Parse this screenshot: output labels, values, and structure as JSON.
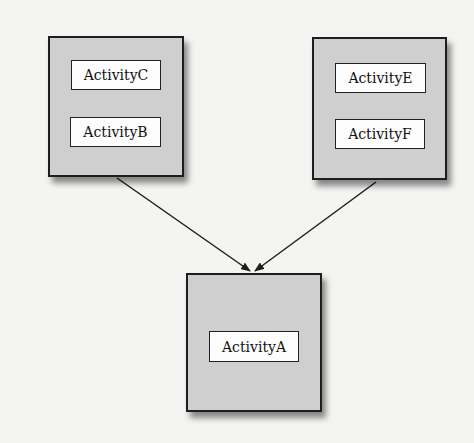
{
  "diagram": {
    "nodes": [
      {
        "id": "left",
        "labels": [
          "ActivityC",
          "ActivityB"
        ]
      },
      {
        "id": "right",
        "labels": [
          "ActivityE",
          "ActivityF"
        ]
      },
      {
        "id": "bottom",
        "labels": [
          "ActivityA"
        ]
      }
    ],
    "edges": [
      {
        "from": "left",
        "to": "bottom"
      },
      {
        "from": "right",
        "to": "bottom"
      }
    ],
    "colors": {
      "box_fill": "#cfcfcf",
      "label_fill": "#fdfdfd",
      "stroke": "#1e1e1e",
      "background": "#f4f4f2"
    }
  }
}
